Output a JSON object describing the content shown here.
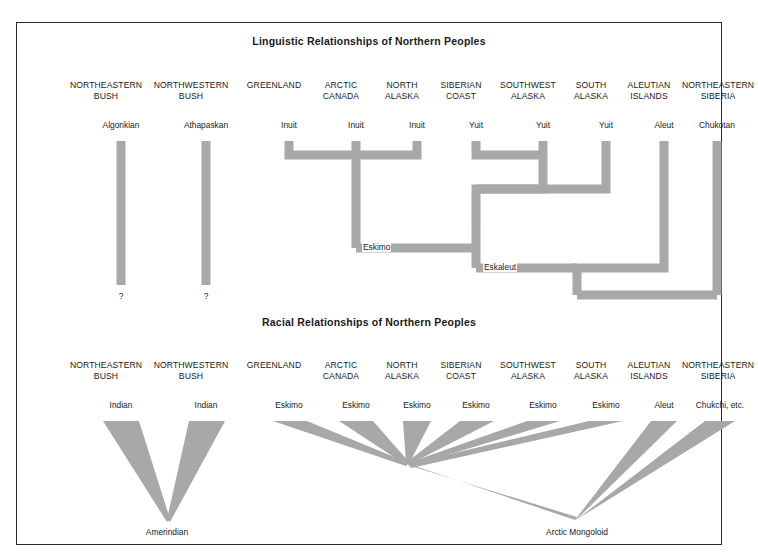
{
  "figure": {
    "border_color": "#2b2b2b",
    "branch_color": "#a8a8a8",
    "background": "#ffffff"
  },
  "linguistic": {
    "title": "Linguistic Relationships of Northern Peoples",
    "columns": [
      {
        "region": "NORTHEASTERN\nBUSH",
        "leaf": "Algonkian",
        "x": 104
      },
      {
        "region": "NORTHWESTERN\nBUSH",
        "leaf": "Athapaskan",
        "x": 189
      },
      {
        "region": "GREENLAND",
        "leaf": "Inuit",
        "x": 272
      },
      {
        "region": "ARCTIC\nCANADA",
        "leaf": "Inuit",
        "x": 339
      },
      {
        "region": "NORTH\nALASKA",
        "leaf": "Inuit",
        "x": 400
      },
      {
        "region": "SIBERIAN\nCOAST",
        "leaf": "Yuit",
        "x": 459
      },
      {
        "region": "SOUTHWEST\nALASKA",
        "leaf": "Yuit",
        "x": 526
      },
      {
        "region": "SOUTH\nALASKA",
        "leaf": "Yuit",
        "x": 589
      },
      {
        "region": "ALEUTIAN\nISLANDS",
        "leaf": "Aleut",
        "x": 647
      },
      {
        "region": "NORTHEASTERN\nSIBERIA",
        "leaf": "Chukotan",
        "x": 716
      }
    ],
    "internal_nodes": [
      {
        "label": "Eskimo",
        "x": 365,
        "y": 225
      },
      {
        "label": "Eskaleut",
        "x": 481,
        "y": 245
      }
    ],
    "unknown_markers": [
      {
        "label": "?",
        "x": 104,
        "y": 274
      },
      {
        "label": "?",
        "x": 189,
        "y": 274
      }
    ]
  },
  "racial": {
    "title": "Racial Relationships of Northern Peoples",
    "columns": [
      {
        "region": "NORTHEASTERN\nBUSH",
        "leaf": "Indian",
        "x": 104
      },
      {
        "region": "NORTHWESTERN\nBUSH",
        "leaf": "Indian",
        "x": 189
      },
      {
        "region": "GREENLAND",
        "leaf": "Eskimo",
        "x": 272
      },
      {
        "region": "ARCTIC\nCANADA",
        "leaf": "Eskimo",
        "x": 339
      },
      {
        "region": "NORTH\nALASKA",
        "leaf": "Eskimo",
        "x": 400
      },
      {
        "region": "SIBERIAN\nCOAST",
        "leaf": "Eskimo",
        "x": 459
      },
      {
        "region": "SOUTHWEST\nALASKA",
        "leaf": "Eskimo",
        "x": 526
      },
      {
        "region": "SOUTH\nALASKA",
        "leaf": "Eskimo",
        "x": 589
      },
      {
        "region": "ALEUTIAN\nISLANDS",
        "leaf": "Aleut",
        "x": 647
      },
      {
        "region": "NORTHEASTERN\nSIBERIA",
        "leaf": "Chukchi, etc.",
        "x": 716
      }
    ],
    "convergence_nodes": [
      {
        "label": "Amerindian",
        "x": 150,
        "y": 521
      },
      {
        "label": "Arctic Mongoloid",
        "x": 560,
        "y": 521
      }
    ]
  }
}
